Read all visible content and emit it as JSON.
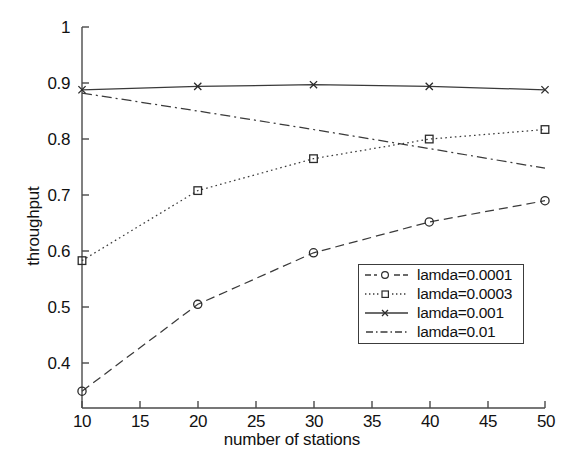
{
  "chart_data": {
    "type": "line",
    "title": "",
    "xlabel": "number of stations",
    "ylabel": "throughput",
    "x": [
      10,
      20,
      30,
      40,
      50
    ],
    "xlim": [
      10,
      50
    ],
    "ylim": [
      0.32,
      1.0
    ],
    "xticks": [
      10,
      15,
      20,
      25,
      30,
      35,
      40,
      45,
      50
    ],
    "xticklabels": [
      "10",
      "15",
      "20",
      "25",
      "30",
      "35",
      "40",
      "45",
      "50"
    ],
    "yticks": [
      0.4,
      0.5,
      0.6,
      0.7,
      0.8,
      0.9,
      1
    ],
    "yticklabels": [
      "0.4",
      "0.5",
      "0.6",
      "0.7",
      "0.8",
      "0.9",
      "1"
    ],
    "grid": false,
    "legend_position": "center-right",
    "series": [
      {
        "name": "lamda=0.0001",
        "marker": "circle",
        "linestyle": "dashed",
        "values": [
          0.35,
          0.505,
          0.597,
          0.652,
          0.69
        ]
      },
      {
        "name": "lamda=0.0003",
        "marker": "square",
        "linestyle": "dotted",
        "values": [
          0.583,
          0.708,
          0.765,
          0.8,
          0.817
        ]
      },
      {
        "name": "lamda=0.001",
        "marker": "x",
        "linestyle": "solid",
        "values": [
          0.888,
          0.894,
          0.897,
          0.894,
          0.888
        ]
      },
      {
        "name": "lamda=0.01",
        "marker": "none",
        "linestyle": "dashdot",
        "values": [
          0.882,
          0.85,
          0.817,
          0.783,
          0.748
        ]
      }
    ]
  },
  "legend": {
    "entries": [
      {
        "label": "lamda=0.0001"
      },
      {
        "label": "lamda=0.0003"
      },
      {
        "label": "lamda=0.001"
      },
      {
        "label": "lamda=0.01"
      }
    ]
  },
  "colors": {
    "line": "#3a3a3a",
    "axis": "#4a4a4a",
    "text": "#111111",
    "background": "#ffffff"
  }
}
